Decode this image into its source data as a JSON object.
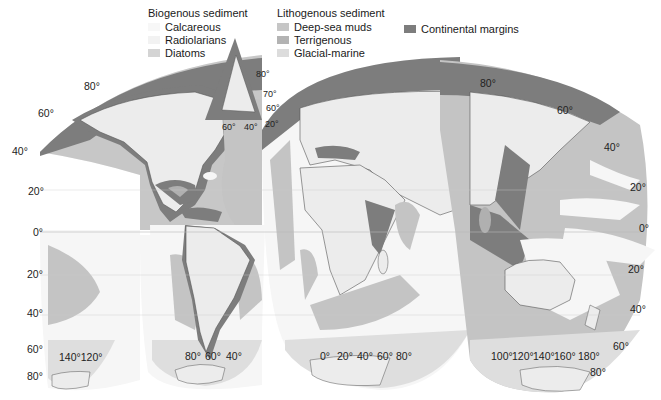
{
  "legend": {
    "biogenous": {
      "title": "Biogenous sediment",
      "items": [
        {
          "label": "Calcareous",
          "color": "#f7f7f7"
        },
        {
          "label": "Radiolarians",
          "color": "#f2f2f2"
        },
        {
          "label": "Diatoms",
          "color": "#d4d4d4"
        }
      ]
    },
    "lithogenous": {
      "title": "Lithogenous sediment",
      "items": [
        {
          "label": "Deep-sea muds",
          "color": "#c6c6c6"
        },
        {
          "label": "Terrigenous",
          "color": "#b3b3b3"
        },
        {
          "label": "Glacial-marine",
          "color": "#dcdcdc"
        }
      ]
    },
    "continental": {
      "label": "Continental margins",
      "color": "#7d7d7d"
    }
  },
  "colors": {
    "land": "#ececec",
    "calcareous": "#f6f6f6",
    "deep_sea_muds": "#c4c4c4",
    "terrigenous": "#b0b0b0",
    "margins": "#7d7d7d",
    "glacial": "#dedede",
    "coast": "#555555"
  },
  "inset": {
    "labels": {
      "lat80": "80°",
      "lat70": "70°",
      "lat60": "60°",
      "lon60": "60°",
      "lon40": "40°",
      "lon20": "20°"
    }
  },
  "latitude_labels": {
    "left": [
      "80°",
      "60°",
      "40°",
      "20°",
      "0°",
      "20°",
      "40°",
      "60°",
      "80°"
    ],
    "right": [
      "80°",
      "60°",
      "40°",
      "20°",
      "0°",
      "20°",
      "40°",
      "60°",
      "80°"
    ]
  },
  "longitude_labels": {
    "pacific_west": "140°120°",
    "americas": [
      "80°",
      "60°",
      "40°"
    ],
    "africa": [
      "0°",
      "20°",
      "40°",
      "60°",
      "80°"
    ],
    "asia_pacific": [
      "100°",
      "120°",
      "140°",
      "160°",
      "180°"
    ]
  }
}
